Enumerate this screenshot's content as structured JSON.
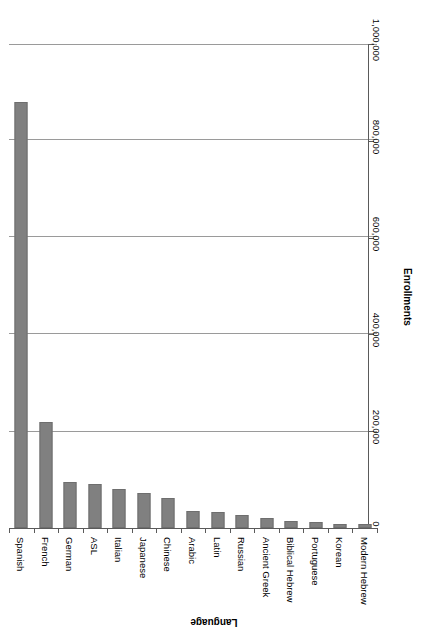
{
  "chart_data": {
    "type": "bar",
    "title": "",
    "subtitle": "",
    "xlabel": "Language",
    "ylabel": "Enrollments",
    "orientation": "vertical-bars-rotated-page",
    "grid": true,
    "legend": false,
    "ylim": [
      0,
      1000000
    ],
    "ytick_labels": [
      "0",
      "200,000",
      "400,000",
      "600,000",
      "800,000",
      "1,000,000"
    ],
    "ytick_values": [
      0,
      200000,
      400000,
      600000,
      800000,
      1000000
    ],
    "categories": [
      "Spanish",
      "French",
      "German",
      "ASL",
      "Italian",
      "Japanese",
      "Chinese",
      "Arabic",
      "Latin",
      "Russian",
      "Ancient Greek",
      "Biblical Hebrew",
      "Portuguese",
      "Korean",
      "Modern Hebrew"
    ],
    "values": [
      880000,
      219000,
      96000,
      91000,
      80000,
      73000,
      61000,
      35000,
      33000,
      27000,
      21000,
      14000,
      12000,
      9000,
      9000
    ],
    "bar_color": "#808080",
    "gridline_color": "#9a9a9a",
    "axis_color": "#5a5a5a"
  }
}
